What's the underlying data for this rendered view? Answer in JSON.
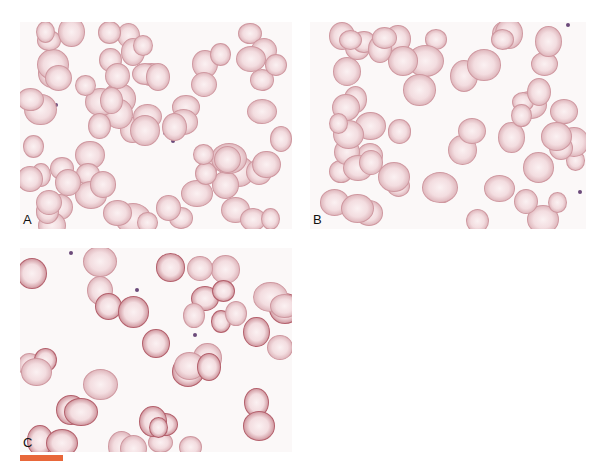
{
  "figure": {
    "panels": [
      {
        "id": "A",
        "label": "A",
        "description": "Peripheral blood smear with mixed red cells, target and fragmented forms"
      },
      {
        "id": "B",
        "label": "B",
        "description": "Peripheral blood smear with oval and rounded red cells"
      },
      {
        "id": "C",
        "label": "C",
        "description": "Peripheral blood smear with darker round red cells and poikilocytes"
      }
    ],
    "caption": "",
    "colors": {
      "cell_fill": "#f3dde0",
      "cell_rim": "#c98a94",
      "dark_cell": "#b85a66",
      "accent_bar": "#e8673a"
    }
  }
}
